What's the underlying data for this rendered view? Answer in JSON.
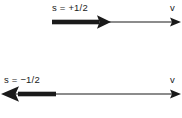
{
  "figure": {
    "background_color": "#ffffff",
    "stroke_color": "#1a1a1a",
    "width": 182,
    "height": 118
  },
  "rows": [
    {
      "id": "spin-up",
      "spin_label": "s = +1/2",
      "axis_label": "v",
      "spin_arrow_direction": "right",
      "velocity_arrow_direction": "right"
    },
    {
      "id": "spin-down",
      "spin_label": "s = −1/2",
      "axis_label": "v",
      "spin_arrow_direction": "left",
      "velocity_arrow_direction": "right"
    }
  ]
}
